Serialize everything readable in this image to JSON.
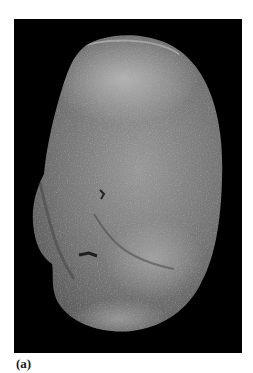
{
  "figure": {
    "label": "(a)",
    "background_color": "#000000",
    "specimen_base_color": "#6e6e6e",
    "specimen_highlight_color": "#b5b5b5",
    "specimen_shadow_color": "#3a3a3a"
  }
}
